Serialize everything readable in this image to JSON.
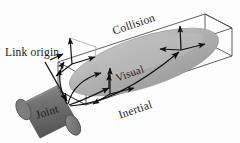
{
  "figure": {
    "labels": {
      "link_origin": "Link origin",
      "collision": "Collision",
      "visual": "Visual",
      "inertial": "Inertial",
      "joint": "Joint"
    },
    "colors": {
      "background": "#fdfdfd",
      "ellipse_fill": "#b2b2b2",
      "ellipse_highlight": "#c9c9c9",
      "cylinder_fill": "#6e6e6e",
      "cylinder_shadow": "#555555",
      "cylinder_cap": "#858585",
      "box_stroke": "#4a4a4a",
      "arrow_stroke": "#111111",
      "text": "#1a1a1a"
    },
    "elements": {
      "collision_box_name": "collision-bounding-box",
      "visual_ellipse_name": "visual-mesh-ellipse",
      "joint_cylinder_name": "joint-cylinder",
      "frames": [
        {
          "name": "link-origin-frame",
          "axes": 3
        },
        {
          "name": "visual-frame",
          "axes": 3
        },
        {
          "name": "collision-frame",
          "axes": 3
        },
        {
          "name": "inertial-frame",
          "axes": 3
        }
      ],
      "curved_arrows": 4
    }
  }
}
